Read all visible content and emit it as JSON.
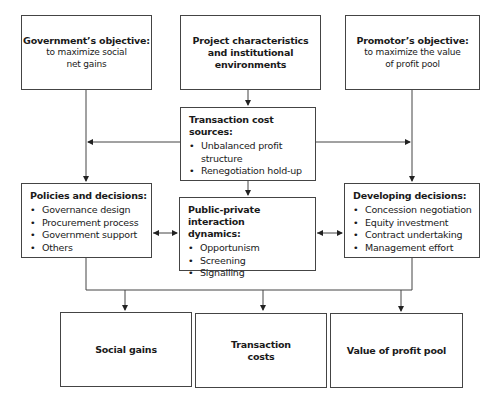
{
  "diagram": {
    "government": {
      "title": "Government’s objective:",
      "text": [
        "to maximize social",
        "net gains"
      ]
    },
    "project": {
      "title": [
        "Project characteristics",
        "and institutional",
        "environments"
      ]
    },
    "promotor": {
      "title": "Promotor’s objective:",
      "text": [
        "to maximize the value",
        "of profit pool"
      ]
    },
    "transaction_sources": {
      "title": "Transaction cost sources:",
      "items": [
        "Unbalanced profit structure",
        "Renegotiation hold-up"
      ]
    },
    "policies": {
      "title": "Policies and decisions:",
      "items": [
        "Governance design",
        "Procurement process",
        "Government support",
        "Others"
      ]
    },
    "interaction": {
      "title": [
        "Public-private interaction",
        "dynamics:"
      ],
      "items": [
        "Opportunism",
        "Screening",
        "Signalling"
      ]
    },
    "developing": {
      "title": "Developing decisions:",
      "items": [
        "Concession negotiation",
        "Equity investment",
        "Contract undertaking",
        "Management effort"
      ]
    },
    "outcomes": [
      {
        "label": [
          "Social gains"
        ]
      },
      {
        "label": [
          "Transaction",
          "costs"
        ]
      },
      {
        "label": [
          "Value of profit pool"
        ]
      }
    ]
  }
}
